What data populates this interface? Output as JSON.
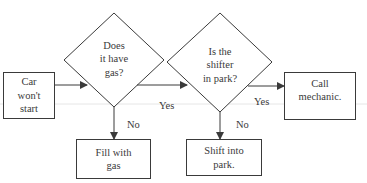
{
  "diagram": {
    "type": "flowchart",
    "colors": {
      "stroke": "#3a3a3a",
      "text": "#3a3a3a",
      "background": "#ffffff",
      "guide_line": "#e6e6e6"
    },
    "nodes": [
      {
        "id": "start",
        "shape": "rectangle",
        "label": "Car won't start",
        "lines": [
          "Car",
          "won't",
          "start"
        ]
      },
      {
        "id": "q_gas",
        "shape": "diamond",
        "label": "Does it have gas?",
        "lines": [
          "Does",
          "it have",
          "gas?"
        ]
      },
      {
        "id": "q_park",
        "shape": "diamond",
        "label": "Is the shifter in park?",
        "lines": [
          "Is the",
          "shifter",
          "in park?"
        ]
      },
      {
        "id": "call",
        "shape": "rectangle",
        "label": "Call mechanic.",
        "lines": [
          "Call",
          "mechanic."
        ]
      },
      {
        "id": "fill",
        "shape": "rectangle",
        "label": "Fill with gas",
        "lines": [
          "Fill with",
          "gas"
        ]
      },
      {
        "id": "shift",
        "shape": "rectangle",
        "label": "Shift into park.",
        "lines": [
          "Shift into",
          "park."
        ]
      }
    ],
    "edges": [
      {
        "from": "start",
        "to": "q_gas",
        "label": ""
      },
      {
        "from": "q_gas",
        "to": "q_park",
        "label": "Yes"
      },
      {
        "from": "q_gas",
        "to": "fill",
        "label": "No"
      },
      {
        "from": "q_park",
        "to": "call",
        "label": "Yes"
      },
      {
        "from": "q_park",
        "to": "shift",
        "label": "No"
      }
    ]
  }
}
